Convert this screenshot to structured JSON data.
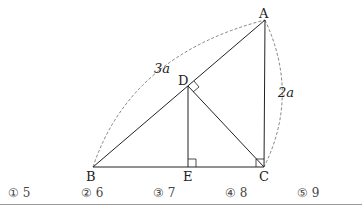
{
  "figure": {
    "points": {
      "A": {
        "label": "A",
        "x": 265,
        "y": 20
      },
      "B": {
        "label": "B",
        "x": 93,
        "y": 167
      },
      "C": {
        "label": "C",
        "x": 264,
        "y": 167
      },
      "D": {
        "label": "D",
        "x": 188,
        "y": 86
      },
      "E": {
        "label": "E",
        "x": 188,
        "y": 167
      }
    },
    "lengths": {
      "AB": "3a",
      "AC": "2a"
    },
    "right_angles": [
      "ADC",
      "DEC",
      "ACB"
    ]
  },
  "choices": [
    {
      "marker": "①",
      "value": "5"
    },
    {
      "marker": "②",
      "value": "6"
    },
    {
      "marker": "③",
      "value": "7"
    },
    {
      "marker": "④",
      "value": "8"
    },
    {
      "marker": "⑤",
      "value": "9"
    }
  ]
}
